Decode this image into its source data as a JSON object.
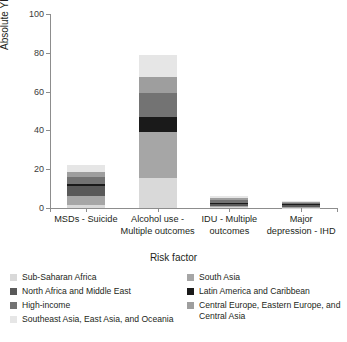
{
  "chart_data": {
    "type": "bar",
    "subtype": "stacked-bar",
    "title": "",
    "xlabel": "Risk factor",
    "ylabel": "Absolute YLLs (millions)",
    "ylim": [
      0,
      100
    ],
    "yticks": [
      0,
      20,
      40,
      60,
      80,
      100
    ],
    "grid": false,
    "legend_position": "bottom",
    "categories": [
      "MSDs - Suicide",
      "Alcohol use - Multiple outcomes",
      "IDU - Multiple outcomes",
      "Major depression - IHD"
    ],
    "category_lines": [
      [
        "MSDs - Suicide"
      ],
      [
        "Alcohol use -",
        "Multiple outcomes"
      ],
      [
        "IDU - Multiple",
        "outcomes"
      ],
      [
        "Major",
        "depression - IHD"
      ]
    ],
    "series": [
      {
        "name": "Sub-Saharan Africa",
        "color": "#d9d9d9",
        "values": [
          1.6,
          15.5,
          0.3,
          0.2
        ]
      },
      {
        "name": "South Asia",
        "color": "#a6a6a6",
        "values": [
          4.4,
          23.5,
          0.7,
          0.5
        ]
      },
      {
        "name": "North Africa and Middle East",
        "color": "#595959",
        "values": [
          5.2,
          0.4,
          1.1,
          0.9
        ]
      },
      {
        "name": "Latin America and Caribbean",
        "color": "#1a1a1a",
        "values": [
          1.1,
          7.6,
          0.6,
          0.3
        ]
      },
      {
        "name": "High-income",
        "color": "#737373",
        "values": [
          3.9,
          12.4,
          1.5,
          0.8
        ]
      },
      {
        "name": "Central Europe, Eastern Europe, and Central Asia",
        "color": "#9e9e9e",
        "values": [
          2.6,
          8.3,
          0.9,
          0.5
        ]
      },
      {
        "name": "Southeast Asia, East Asia, and Oceania",
        "color": "#e6e6e6",
        "values": [
          3.2,
          11.3,
          0.9,
          0.3
        ]
      }
    ],
    "totals": [
      22.0,
      79.0,
      6.0,
      3.5
    ]
  },
  "legend": {
    "left": [
      {
        "label": "Sub-Saharan Africa",
        "color": "#d9d9d9"
      },
      {
        "label": "North Africa and Middle East",
        "color": "#595959"
      },
      {
        "label": "High-income",
        "color": "#737373"
      },
      {
        "label": "Southeast Asia, East Asia, and Oceania",
        "color": "#e6e6e6"
      }
    ],
    "right": [
      {
        "label": "South Asia",
        "color": "#a6a6a6"
      },
      {
        "label": "Latin America and Caribbean",
        "color": "#1a1a1a"
      },
      {
        "label": "Central Europe, Eastern Europe, and Central Asia",
        "color": "#9e9e9e"
      }
    ]
  },
  "colors": {
    "axis": "#8d8d8d",
    "text": "#231f20",
    "background": "#ffffff"
  }
}
